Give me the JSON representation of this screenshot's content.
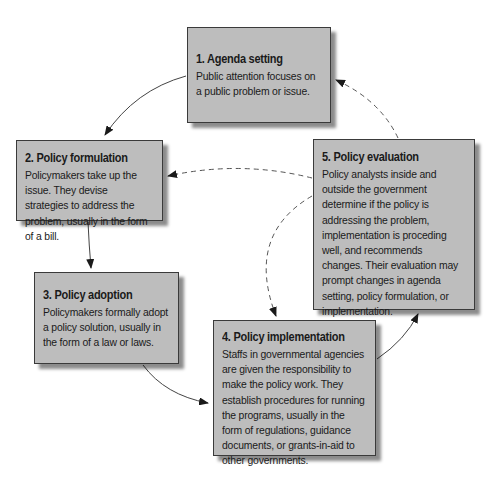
{
  "diagram": {
    "type": "policy-process-cycle",
    "stages": [
      {
        "title": "1. Agenda setting",
        "description": "Public attention focuses on a public problem or issue."
      },
      {
        "title": "2. Policy formulation",
        "description": "Policymakers take up the issue. They devise strategies to address the problem, usually in the form of a bill."
      },
      {
        "title": "3. Policy adoption",
        "description": "Policymakers formally adopt a policy solution, usually in the form of a law or laws."
      },
      {
        "title": "4. Policy implementation",
        "description": "Staffs in governmental agencies are given the responsibility to make the policy work. They establish procedures for running the programs, usually in the form of regulations, guidance documents, or grants-in-aid to other governments."
      },
      {
        "title": "5. Policy evaluation",
        "description": "Policy analysts inside and outside the government determine if the policy is addressing the problem, implementation is proceding well, and recommends changes. Their evaluation may prompt changes in agenda setting, policy formulation, or implementation."
      }
    ],
    "arrows": [
      {
        "from": "1",
        "to": "2",
        "style": "solid"
      },
      {
        "from": "2",
        "to": "3",
        "style": "solid"
      },
      {
        "from": "3",
        "to": "4",
        "style": "solid"
      },
      {
        "from": "4",
        "to": "5",
        "style": "solid"
      },
      {
        "from": "5",
        "to": "1",
        "style": "dashed"
      },
      {
        "from": "5",
        "to": "2",
        "style": "dashed"
      },
      {
        "from": "5",
        "to": "4",
        "style": "dashed"
      }
    ],
    "colors": {
      "box_fill": "#bdbdbd",
      "border": "#3a3a3a",
      "arrow": "#333333"
    }
  }
}
